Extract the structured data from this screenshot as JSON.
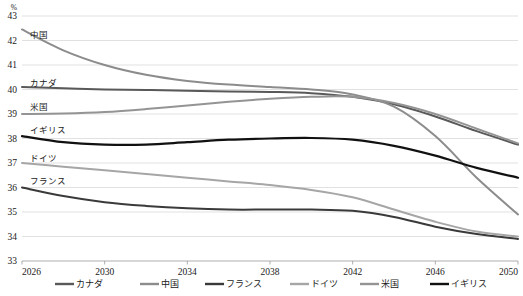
{
  "chart_data": {
    "type": "line",
    "title": "",
    "xlabel": "",
    "ylabel": "",
    "unit_label": "%",
    "grid": true,
    "legend_position": "bottom",
    "xlim": [
      2026,
      2050
    ],
    "ylim": [
      33,
      43
    ],
    "x_ticks": [
      "2026",
      "2030",
      "2034",
      "2038",
      "2042",
      "2046",
      "2050"
    ],
    "y_ticks": [
      "33",
      "34",
      "35",
      "36",
      "37",
      "38",
      "39",
      "40",
      "41",
      "42",
      "43"
    ],
    "x": [
      2026,
      2028,
      2030,
      2032,
      2034,
      2036,
      2038,
      2040,
      2042,
      2044,
      2046,
      2048,
      2050
    ],
    "series": [
      {
        "name": "カナダ",
        "color": "#595959",
        "width": 2.0,
        "inline_label": "カナダ",
        "values": [
          40.1,
          40.05,
          40.0,
          39.98,
          39.95,
          39.92,
          39.9,
          39.85,
          39.7,
          39.4,
          38.9,
          38.3,
          37.75
        ]
      },
      {
        "name": "中国",
        "color": "#8c8c8c",
        "width": 2.0,
        "inline_label": "中国",
        "values": [
          42.45,
          41.6,
          41.0,
          40.6,
          40.35,
          40.2,
          40.1,
          40.0,
          39.8,
          39.3,
          38.1,
          36.4,
          34.9
        ]
      },
      {
        "name": "フランス",
        "color": "#3a3a3a",
        "width": 2.0,
        "inline_label": "フランス",
        "values": [
          36.0,
          35.65,
          35.4,
          35.25,
          35.15,
          35.1,
          35.1,
          35.1,
          35.05,
          34.8,
          34.4,
          34.1,
          33.9
        ]
      },
      {
        "name": "ドイツ",
        "color": "#a6a6a6",
        "width": 2.0,
        "inline_label": "ドイツ",
        "values": [
          37.0,
          36.85,
          36.7,
          36.55,
          36.4,
          36.25,
          36.1,
          35.9,
          35.6,
          35.1,
          34.6,
          34.2,
          34.0
        ]
      },
      {
        "name": "米国",
        "color": "#949494",
        "width": 2.0,
        "inline_label": "米国",
        "values": [
          39.0,
          39.02,
          39.08,
          39.2,
          39.35,
          39.5,
          39.62,
          39.7,
          39.7,
          39.45,
          39.0,
          38.4,
          37.8
        ]
      },
      {
        "name": "イギリス",
        "color": "#111111",
        "width": 2.2,
        "inline_label": "イギリス",
        "values": [
          38.1,
          37.85,
          37.75,
          37.75,
          37.85,
          37.95,
          38.0,
          38.02,
          37.95,
          37.7,
          37.3,
          36.8,
          36.4
        ]
      }
    ],
    "inline_annotations": [
      {
        "text": "中国",
        "x_px": 30,
        "y_px": 38
      },
      {
        "text": "カナダ",
        "x_px": 30,
        "y_px": 86
      },
      {
        "text": "米国",
        "x_px": 30,
        "y_px": 110
      },
      {
        "text": "イギリス",
        "x_px": 30,
        "y_px": 133
      },
      {
        "text": "ドイツ",
        "x_px": 30,
        "y_px": 161
      },
      {
        "text": "フランス",
        "x_px": 30,
        "y_px": 184
      }
    ],
    "legend_entries": [
      {
        "label": "カナダ",
        "color": "#595959"
      },
      {
        "label": "中国",
        "color": "#8c8c8c"
      },
      {
        "label": "フランス",
        "color": "#3a3a3a"
      },
      {
        "label": "ドイツ",
        "color": "#a6a6a6"
      },
      {
        "label": "米国",
        "color": "#949494"
      },
      {
        "label": "イギリス",
        "color": "#111111"
      }
    ]
  }
}
